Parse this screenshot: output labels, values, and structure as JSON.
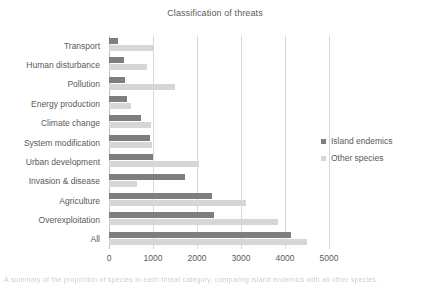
{
  "chart_data": {
    "type": "bar",
    "orientation": "horizontal",
    "title": "Classification of threats",
    "xlabel": "",
    "ylabel": "",
    "xlim": [
      0,
      5000
    ],
    "xticks": [
      0,
      1000,
      2000,
      3000,
      4000,
      5000
    ],
    "xtick_labels": [
      "0",
      "1000",
      "2000",
      "3000",
      "4000",
      "5000"
    ],
    "grid": true,
    "legend_position": "right",
    "categories": [
      "Transport",
      "Human disturbance",
      "Pollution",
      "Energy production",
      "Climate change",
      "System modification",
      "Urban development",
      "Invasion & disease",
      "Agriculture",
      "Overexploitation",
      "All"
    ],
    "series": [
      {
        "name": "Island endemics",
        "color": "#7e7e7e",
        "values": [
          210,
          340,
          360,
          400,
          720,
          925,
          1000,
          1720,
          2340,
          2380,
          4140
        ]
      },
      {
        "name": "Other species",
        "color": "#d6d6d6",
        "values": [
          1000,
          865,
          1500,
          490,
          960,
          985,
          2045,
          630,
          3110,
          3840,
          4500
        ]
      }
    ]
  },
  "legend": {
    "items": [
      {
        "label": "Island endemics",
        "color": "#7e7e7e"
      },
      {
        "label": "Other species",
        "color": "#d6d6d6"
      }
    ]
  },
  "caption": {
    "text": "truncated caption line below figure"
  }
}
